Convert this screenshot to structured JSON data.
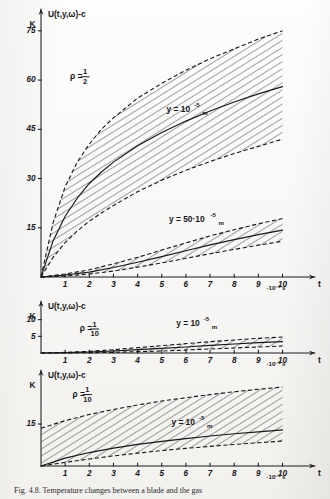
{
  "figure": {
    "caption": "Fig. 4.8. Temperature changes between a blade and the gas"
  },
  "chart_data": [
    {
      "id": "panel-top",
      "type": "area",
      "title": "U(t,y,ω)-c",
      "xlabel": "t",
      "x_unit": "·10⁻³ s",
      "ylabel": "U(t,y,ω)-c",
      "y_unit": "K",
      "xlim": [
        0,
        10.6
      ],
      "ylim": [
        0,
        78
      ],
      "grid": false,
      "xticks": [
        1,
        2,
        3,
        4,
        5,
        6,
        7,
        8,
        9,
        10
      ],
      "xticklabels": [
        "1",
        "2",
        "3",
        "4",
        "5",
        "6",
        "7",
        "8",
        "9",
        "10"
      ],
      "yticks": [
        15,
        30,
        45,
        60,
        75
      ],
      "yticklabels": [
        "15",
        "30",
        "45",
        "60",
        "75"
      ],
      "annotations": [
        {
          "text": "ρ =",
          "num": "1",
          "den": "2",
          "kind": "fraction",
          "x": 1.2,
          "y": 61
        },
        {
          "text": "y = 10",
          "sup": "-5",
          "sub": "m",
          "kind": "label",
          "x": 5.2,
          "y": 51
        },
        {
          "text": "y = 50·10",
          "sup": "-5",
          "sub": "m",
          "kind": "label",
          "x": 5.3,
          "y": 17.5
        }
      ],
      "series": [
        {
          "name": "y = 10^-5 m  (band)",
          "kind": "band",
          "x": [
            0,
            0.5,
            1,
            1.5,
            2,
            2.5,
            3,
            4,
            5,
            6,
            7,
            8,
            9,
            10
          ],
          "upper": [
            0,
            16.5,
            27.5,
            35.0,
            40.5,
            45.0,
            48.5,
            54.5,
            59.0,
            63.0,
            66.5,
            69.5,
            72.5,
            75.0
          ],
          "lower": [
            0,
            6.0,
            10.5,
            14.0,
            17.0,
            19.5,
            21.8,
            26.0,
            29.5,
            32.5,
            35.2,
            37.6,
            39.8,
            42.0
          ]
        },
        {
          "name": "y = 10^-5 m  (centre)",
          "kind": "line",
          "x": [
            0,
            0.5,
            1,
            1.5,
            2,
            2.5,
            3,
            4,
            5,
            6,
            7,
            8,
            9,
            10
          ],
          "y": [
            0,
            11.0,
            18.5,
            24.0,
            28.5,
            32.0,
            35.0,
            40.0,
            44.0,
            47.5,
            50.6,
            53.3,
            55.8,
            58.0
          ]
        },
        {
          "name": "y = 50·10^-5 m  (band)",
          "kind": "band",
          "x": [
            0,
            1,
            2,
            3,
            4,
            5,
            6,
            7,
            8,
            9,
            10
          ],
          "upper": [
            0,
            0.9,
            2.2,
            4.0,
            6.0,
            8.2,
            10.4,
            12.5,
            14.4,
            16.2,
            17.8
          ],
          "lower": [
            0,
            0.3,
            0.9,
            1.8,
            3.0,
            4.3,
            5.7,
            7.1,
            8.4,
            9.7,
            10.9
          ]
        },
        {
          "name": "y = 50·10^-5 m  (centre)",
          "kind": "line",
          "x": [
            0,
            1,
            2,
            3,
            4,
            5,
            6,
            7,
            8,
            9,
            10
          ],
          "y": [
            0,
            0.6,
            1.5,
            2.9,
            4.5,
            6.2,
            8.0,
            9.8,
            11.4,
            12.9,
            14.3
          ]
        }
      ]
    },
    {
      "id": "panel-middle",
      "type": "area",
      "title": "U(t,y,ω)-c",
      "xlabel": "t",
      "x_unit": "·10⁻³ s",
      "ylabel": "U(t,y,ω)-c",
      "y_unit": "K",
      "xlim": [
        0,
        10.6
      ],
      "ylim": [
        0,
        12
      ],
      "grid": false,
      "xticks": [
        1,
        2,
        3,
        4,
        5,
        6,
        7,
        8,
        9,
        10
      ],
      "xticklabels": [
        "1",
        "2",
        "3",
        "4",
        "5",
        "6",
        "7",
        "8",
        "9",
        "10"
      ],
      "yticks": [
        5,
        10
      ],
      "yticklabels": [
        "5",
        "10"
      ],
      "annotations": [
        {
          "text": "ρ =",
          "num": "1",
          "den": "10",
          "kind": "fraction",
          "x": 1.6,
          "y": 7.2
        },
        {
          "text": "y = 10",
          "sup": "-5",
          "sub": "m",
          "kind": "label",
          "x": 5.6,
          "y": 8.8
        }
      ],
      "series": [
        {
          "name": "y = 10^-5 m  (band)",
          "kind": "band",
          "x": [
            0,
            1,
            2,
            3,
            4,
            5,
            6,
            7,
            8,
            9,
            10
          ],
          "upper": [
            0,
            0.2,
            0.5,
            1.0,
            1.6,
            2.2,
            2.8,
            3.4,
            3.9,
            4.4,
            4.8
          ],
          "lower": [
            0,
            0.0,
            0.1,
            0.2,
            0.4,
            0.6,
            0.9,
            1.2,
            1.5,
            1.8,
            2.1
          ]
        },
        {
          "name": "y = 10^-5 m  (centre)",
          "kind": "line",
          "x": [
            0,
            1,
            2,
            3,
            4,
            5,
            6,
            7,
            8,
            9,
            10
          ],
          "y": [
            0,
            0.1,
            0.3,
            0.6,
            1.0,
            1.4,
            1.8,
            2.3,
            2.7,
            3.1,
            3.4
          ]
        }
      ]
    },
    {
      "id": "panel-bottom",
      "type": "area",
      "title": "U(t,y,ω)-c",
      "xlabel": "t",
      "x_unit": "·10⁻³ s",
      "ylabel": "U(t,y,ω)-c",
      "y_unit": "K",
      "xlim": [
        0,
        10.6
      ],
      "ylim": [
        0,
        30
      ],
      "grid": false,
      "xticks": [
        1,
        2,
        3,
        4,
        5,
        6,
        7,
        8,
        9,
        10
      ],
      "xticklabels": [
        "1",
        "2",
        "3",
        "4",
        "5",
        "6",
        "7",
        "8",
        "9",
        "10"
      ],
      "yticks": [
        15
      ],
      "yticklabels": [
        "15"
      ],
      "annotations": [
        {
          "text": "ρ =",
          "num": "1",
          "den": "10",
          "kind": "fraction",
          "x": 1.3,
          "y": 25.5
        },
        {
          "text": "y = 10",
          "sup": "-5",
          "sub": "m",
          "kind": "label",
          "x": 5.4,
          "y": 15.5
        }
      ],
      "series": [
        {
          "name": "y = 10^-5 m  (band)",
          "kind": "band",
          "x": [
            0,
            1,
            2,
            3,
            4,
            5,
            6,
            7,
            8,
            9,
            10
          ],
          "upper": [
            13.5,
            16.2,
            18.4,
            20.2,
            21.8,
            23.2,
            24.4,
            25.5,
            26.5,
            27.4,
            28.2
          ],
          "lower": [
            0,
            1.3,
            2.5,
            3.6,
            4.6,
            5.5,
            6.3,
            7.0,
            7.7,
            8.3,
            8.9
          ]
        },
        {
          "name": "y = 10^-5 m  (centre)",
          "kind": "line",
          "x": [
            0,
            1,
            2,
            3,
            4,
            5,
            6,
            7,
            8,
            9,
            10
          ],
          "y": [
            0,
            2.8,
            4.8,
            6.4,
            7.7,
            8.8,
            9.8,
            10.7,
            11.5,
            12.2,
            12.9
          ]
        }
      ]
    }
  ]
}
